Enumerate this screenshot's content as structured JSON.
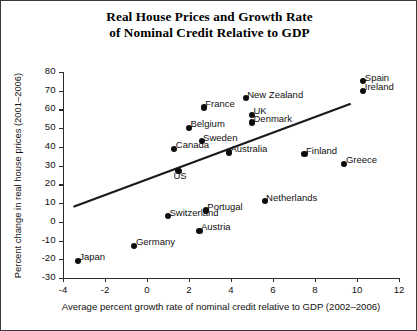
{
  "chart_data": {
    "type": "scatter",
    "title": "Real House Prices and Growth Rate of Nominal Credit Relative to GDP",
    "title_line1": "Real House Prices and Growth Rate",
    "title_line2": "of Nominal Credit Relative to GDP",
    "xlabel": "Average percent growth rate of nominal credit relative to GDP (2002–2006)",
    "ylabel": "Percent change in real house prices (2001–2006)",
    "xlim": [
      -4,
      12
    ],
    "ylim": [
      -30,
      80
    ],
    "xticks": [
      "-4",
      "-2",
      "0",
      "2",
      "4",
      "6",
      "8",
      "10",
      "12"
    ],
    "xtick_values": [
      -4,
      -2,
      0,
      2,
      4,
      6,
      8,
      10,
      12
    ],
    "yticks": [
      "80",
      "70",
      "60",
      "50",
      "40",
      "30",
      "20",
      "10",
      "0",
      "-10",
      "-20",
      "-30"
    ],
    "ytick_values": [
      80,
      70,
      60,
      50,
      40,
      30,
      20,
      10,
      0,
      -10,
      -20,
      -30
    ],
    "grid": false,
    "legend": "none",
    "marker_color": "#0d0d0d",
    "trendline": {
      "x": [
        -3.5,
        9.7
      ],
      "y": [
        8.0,
        63.0
      ],
      "color": "#1a1a1a"
    },
    "points": [
      {
        "label": "Spain",
        "x": 10.3,
        "y": 75,
        "label_pos": "right"
      },
      {
        "label": "Ireland",
        "x": 10.3,
        "y": 70,
        "label_pos": "right"
      },
      {
        "label": "New Zealand",
        "x": 4.7,
        "y": 66,
        "label_pos": "right"
      },
      {
        "label": "France",
        "x": 2.7,
        "y": 61,
        "label_pos": "right"
      },
      {
        "label": "UK",
        "x": 5.0,
        "y": 57,
        "label_pos": "right"
      },
      {
        "label": "Denmark",
        "x": 5.0,
        "y": 53,
        "label_pos": "right"
      },
      {
        "label": "Belgium",
        "x": 2.0,
        "y": 50,
        "label_pos": "right"
      },
      {
        "label": "Sweden",
        "x": 2.6,
        "y": 43,
        "label_pos": "right"
      },
      {
        "label": "Canada",
        "x": 1.3,
        "y": 39,
        "label_pos": "right"
      },
      {
        "label": "Australia",
        "x": 3.9,
        "y": 37,
        "label_pos": "right"
      },
      {
        "label": "Finland",
        "x": 7.5,
        "y": 36,
        "label_pos": "right"
      },
      {
        "label": "Greece",
        "x": 9.4,
        "y": 31,
        "label_pos": "right"
      },
      {
        "label": "US",
        "x": 1.5,
        "y": 27,
        "label_pos": "below"
      },
      {
        "label": "Netherlands",
        "x": 5.6,
        "y": 11,
        "label_pos": "right"
      },
      {
        "label": "Portugal",
        "x": 2.8,
        "y": 6,
        "label_pos": "right"
      },
      {
        "label": "Switzerland",
        "x": 1.0,
        "y": 3,
        "label_pos": "right"
      },
      {
        "label": "Austria",
        "x": 2.5,
        "y": -5,
        "label_pos": "right"
      },
      {
        "label": "Germany",
        "x": -0.6,
        "y": -13,
        "label_pos": "right"
      },
      {
        "label": "Japan",
        "x": -3.3,
        "y": -21,
        "label_pos": "right"
      }
    ]
  }
}
